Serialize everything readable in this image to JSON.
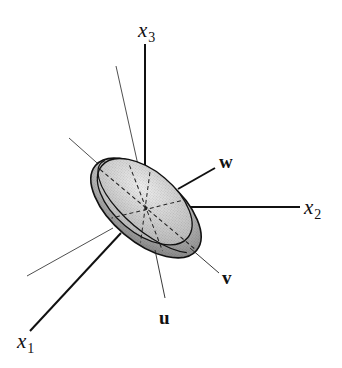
{
  "figure": {
    "type": "3D ellipsoid with coordinate axes and principal axes",
    "axes": [
      {
        "id": "x1",
        "label": "x",
        "subscript": "1"
      },
      {
        "id": "x2",
        "label": "x",
        "subscript": "2"
      },
      {
        "id": "x3",
        "label": "x",
        "subscript": "3"
      }
    ],
    "principal_vectors": [
      {
        "id": "u",
        "label": "u"
      },
      {
        "id": "v",
        "label": "v"
      },
      {
        "id": "w",
        "label": "w"
      }
    ],
    "colors": {
      "line": "#111111",
      "ellipsoid_light": "#d8d8d8",
      "ellipsoid_dark": "#8a8a8a"
    }
  }
}
